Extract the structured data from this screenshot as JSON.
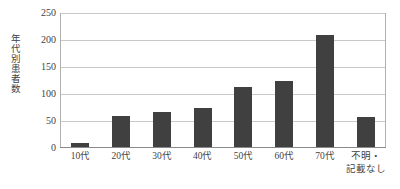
{
  "chart_data": {
    "type": "bar",
    "title": "",
    "subtitle": "",
    "xlabel": "",
    "ylabel": "年代別患者数",
    "categories": [
      "10代",
      "20代",
      "30代",
      "40代",
      "50代",
      "60代",
      "70代",
      "不明・\n記載なし"
    ],
    "values": [
      8,
      58,
      65,
      72,
      112,
      122,
      208,
      55
    ],
    "ylim": [
      0,
      250
    ],
    "yticks": [
      0,
      50,
      100,
      150,
      200,
      250
    ],
    "ytick_labels": [
      "0",
      "50",
      "100",
      "150",
      "200",
      "250"
    ],
    "grid": "horizontal",
    "legend": "none",
    "series": [
      {
        "name": "年代別患者数",
        "values": [
          8,
          58,
          65,
          72,
          112,
          122,
          208,
          55
        ]
      }
    ],
    "colors": {
      "bar": "#404040",
      "gridline": "#c9c9c9",
      "axis": "#8a8a8a",
      "text": "#3f3f3f",
      "background": "#ffffff"
    }
  }
}
